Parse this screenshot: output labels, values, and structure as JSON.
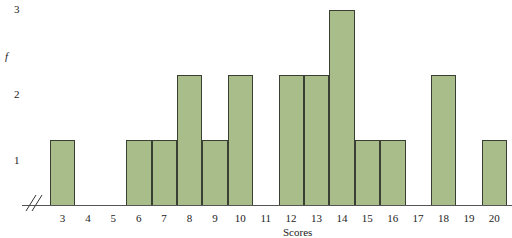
{
  "chart_data": {
    "type": "bar",
    "title": "",
    "xlabel": "Scores",
    "ylabel": "f",
    "categories": [
      "3",
      "4",
      "5",
      "6",
      "7",
      "8",
      "9",
      "10",
      "11",
      "12",
      "13",
      "14",
      "15",
      "16",
      "17",
      "18",
      "19",
      "20"
    ],
    "values": [
      1,
      0,
      0,
      1,
      1,
      2,
      1,
      2,
      0,
      2,
      2,
      3,
      1,
      1,
      0,
      2,
      0,
      1
    ],
    "yticks": [
      "1",
      "2",
      "3"
    ],
    "ylim": [
      0,
      3
    ],
    "grid": false,
    "legend": null,
    "axis_break": true,
    "bar_color": "#a9bd8b",
    "edge_color": "#3a3f33"
  }
}
